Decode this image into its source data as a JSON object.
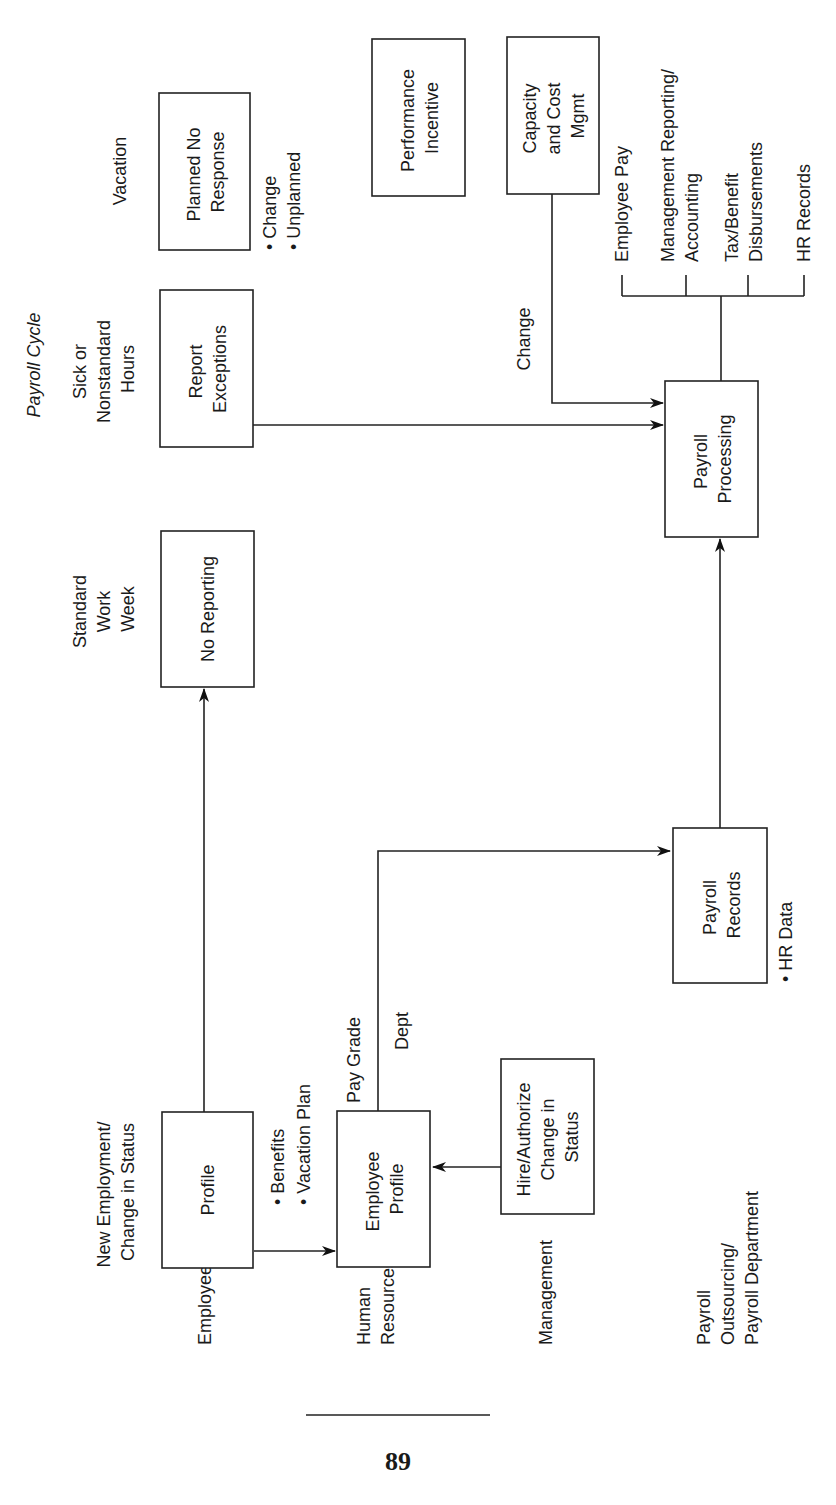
{
  "page": {
    "page_number": "89"
  },
  "diagram": {
    "orientation": "rotated-90-ccw",
    "header": {
      "payroll_cycle": "Payroll Cycle"
    },
    "lanes": [
      {
        "id": "employee",
        "label": "Employee"
      },
      {
        "id": "hr",
        "label_lines": [
          "Human",
          "Resources"
        ]
      },
      {
        "id": "management",
        "label": "Management"
      },
      {
        "id": "payroll",
        "label_lines": [
          "Payroll",
          "Outsourcing/",
          "Payroll Department"
        ]
      }
    ],
    "column_headers": {
      "new_employment": [
        "New Employment/",
        "Change in Status"
      ],
      "standard_week": [
        "Standard",
        "Work",
        "Week"
      ],
      "sick": [
        "Sick or",
        "Nonstandard",
        "Hours"
      ],
      "vacation": "Vacation"
    },
    "nodes": {
      "profile": [
        "Profile"
      ],
      "employee_profile": [
        "Employee",
        "Profile"
      ],
      "hire_authorize": [
        "Hire/Authorize",
        "Change in",
        "Status"
      ],
      "payroll_records": [
        "Payroll",
        "Records"
      ],
      "payroll_processing": [
        "Payroll",
        "Processing"
      ],
      "no_reporting": [
        "No Reporting"
      ],
      "report_exceptions": [
        "Report",
        "Exceptions"
      ],
      "planned_no_response": [
        "Planned No",
        "Response"
      ],
      "performance_incentive": [
        "Performance",
        "Incentive"
      ],
      "capacity_cost": [
        "Capacity",
        "and Cost",
        "Mgmt"
      ]
    },
    "annotations": {
      "profile_to_ep": [
        "• Benefits",
        "• Vacation Plan"
      ],
      "pay_grade": "Pay Grade",
      "dept": "Dept",
      "hr_data": "• HR Data",
      "vacation_bullets": [
        "• Change",
        "• Unplanned"
      ],
      "change": "Change"
    },
    "outputs": [
      [
        "Employee Pay"
      ],
      [
        "Management Reporting/",
        "Accounting"
      ],
      [
        "Tax/Benefit",
        "Disbursements"
      ],
      [
        "HR Records"
      ]
    ],
    "edges": [
      {
        "from": "profile",
        "to": "employee_profile",
        "label": "Benefits, Vacation Plan"
      },
      {
        "from": "profile",
        "to": "no_reporting"
      },
      {
        "from": "hire_authorize",
        "to": "employee_profile"
      },
      {
        "from": "employee_profile",
        "to": "payroll_records",
        "label": "Pay Grade, Dept"
      },
      {
        "from": "payroll_records",
        "to": "payroll_processing"
      },
      {
        "from": "report_exceptions",
        "to": "payroll_processing"
      },
      {
        "from": "capacity_cost",
        "to": "payroll_processing",
        "label": "Change"
      },
      {
        "from": "payroll_processing",
        "to": "outputs"
      }
    ]
  }
}
